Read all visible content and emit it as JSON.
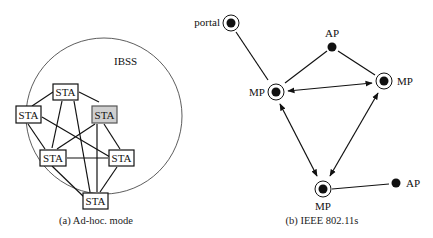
{
  "left": {
    "region_label": "IBSS",
    "caption": "(a) Ad-hoc. mode",
    "stations": [
      {
        "id": "top",
        "label": "STA",
        "x": 53,
        "y": 84,
        "w": 25,
        "h": 16,
        "highlight": false
      },
      {
        "id": "left",
        "label": "STA",
        "x": 16,
        "y": 106,
        "w": 25,
        "h": 17,
        "highlight": false
      },
      {
        "id": "gray",
        "label": "STA",
        "x": 92,
        "y": 106,
        "w": 25,
        "h": 17,
        "highlight": true
      },
      {
        "id": "midleft",
        "label": "STA",
        "x": 40,
        "y": 150,
        "w": 26,
        "h": 16,
        "highlight": false
      },
      {
        "id": "midright",
        "label": "STA",
        "x": 109,
        "y": 150,
        "w": 25,
        "h": 16,
        "highlight": false
      },
      {
        "id": "bottom",
        "label": "STA",
        "x": 83,
        "y": 193,
        "w": 25,
        "h": 16,
        "highlight": false
      }
    ],
    "colors": {
      "highlight_fill": "#cfcfcf",
      "stroke": "#111111"
    }
  },
  "right": {
    "caption": "(b) IEEE 802.11s",
    "nodes": [
      {
        "id": "portal",
        "label": "portal",
        "type": "mesh",
        "x": 231,
        "y": 23,
        "label_x": 222,
        "label_y": 26,
        "anchor": "end"
      },
      {
        "id": "mp_left",
        "label": "MP",
        "type": "mesh",
        "x": 276,
        "y": 92,
        "label_x": 265,
        "label_y": 96,
        "anchor": "end"
      },
      {
        "id": "ap_top",
        "label": "AP",
        "type": "ap",
        "x": 332,
        "y": 47,
        "label_x": 332,
        "label_y": 37,
        "anchor": "middle"
      },
      {
        "id": "mp_right",
        "label": "MP",
        "type": "mesh",
        "x": 384,
        "y": 81,
        "label_x": 398,
        "label_y": 85,
        "anchor": "start"
      },
      {
        "id": "mp_bottom",
        "label": "MP",
        "type": "mesh",
        "x": 323,
        "y": 189,
        "label_x": 323,
        "label_y": 210,
        "anchor": "middle"
      },
      {
        "id": "ap_right",
        "label": "AP",
        "type": "ap",
        "x": 396,
        "y": 183,
        "label_x": 406,
        "label_y": 187,
        "anchor": "start"
      }
    ]
  }
}
